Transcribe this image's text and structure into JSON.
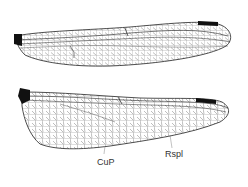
{
  "figure": {
    "wings": [
      {
        "name": "forewing",
        "position": "top"
      },
      {
        "name": "hindwing",
        "position": "bottom"
      }
    ],
    "labels": [
      {
        "id": "cup",
        "text": "CuP",
        "x": 100,
        "y": 164
      },
      {
        "id": "rspl",
        "text": "Rspl",
        "x": 166,
        "y": 156
      }
    ],
    "colors": {
      "vein": "#222222",
      "pterostigma": "#111111",
      "background": "#ffffff"
    }
  }
}
